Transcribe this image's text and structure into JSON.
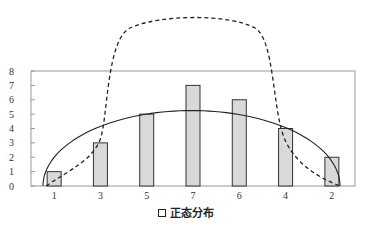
{
  "chart_data": {
    "type": "bar",
    "title": "",
    "xlabel": "",
    "ylabel": "",
    "categories": [
      "1",
      "3",
      "5",
      "7",
      "6",
      "4",
      "2"
    ],
    "values": [
      1,
      3,
      5,
      7,
      6,
      4,
      2
    ],
    "ylim": [
      0,
      8
    ],
    "yticks": [
      0,
      1,
      2,
      3,
      4,
      5,
      6,
      7,
      8
    ],
    "grid": false,
    "legend": {
      "position": "bottom",
      "entries": [
        "正态分布"
      ]
    },
    "series": [
      {
        "name": "正态分布",
        "kind": "bar",
        "values": [
          1,
          3,
          5,
          7,
          6,
          4,
          2
        ]
      }
    ],
    "overlays": [
      {
        "name": "solid-curve",
        "kind": "line",
        "style": "solid",
        "description": "semi-elliptical arc from x-start to x-end, peak ≈ 5.2"
      },
      {
        "name": "dashed-curve",
        "kind": "line",
        "style": "dashed",
        "description": "bell-shaped dashed curve peaking well above plot area (≈ 12)"
      }
    ]
  },
  "colors": {
    "bar_fill": "#d9d9d9",
    "bar_stroke": "#333333",
    "axis": "#999999",
    "curve": "#222222"
  },
  "legend": {
    "label": "正态分布"
  }
}
